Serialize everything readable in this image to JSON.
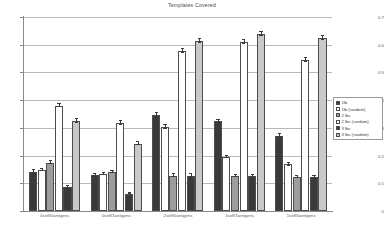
{
  "chart_data": {
    "type": "bar",
    "title": "Templates Covered",
    "xlabel": "",
    "ylabel": "",
    "ylim": [
      0,
      0.7
    ],
    "ytick_values": [
      0,
      0.1,
      0.2,
      0.3,
      0.4,
      0.5,
      0.6,
      0.7
    ],
    "ytick_labels": [
      "0",
      "0.1",
      "0.2",
      "0.3",
      "0.4",
      "0.5",
      "0.6",
      "0.7"
    ],
    "grid": true,
    "legend_position": "right",
    "categories": [
      "0self/0antigens",
      "0self/1antigens",
      "2self/0antigens",
      "1self/1antigens",
      "1self/0antigens"
    ],
    "series": [
      {
        "name": "1lb",
        "color": "#3a3a3a",
        "values": [
          0.142,
          0.13,
          0.345,
          0.323,
          0.272
        ],
        "errors": [
          0.005,
          0.004,
          0.007,
          0.006,
          0.006
        ]
      },
      {
        "name": "1lb (random)",
        "color": "#ffffff",
        "values": [
          0.148,
          0.133,
          0.303,
          0.195,
          0.168
        ],
        "errors": [
          0.004,
          0.004,
          0.006,
          0.005,
          0.005
        ]
      },
      {
        "name": "2 lbs",
        "color": "#9d9d9d",
        "values": [
          0.175,
          0.14,
          0.128,
          0.125,
          0.122
        ],
        "errors": [
          0.005,
          0.004,
          0.004,
          0.004,
          0.004
        ]
      },
      {
        "name": "2 lbs (random)",
        "color": "#ffffff",
        "values": [
          0.38,
          0.318,
          0.578,
          0.61,
          0.545
        ],
        "errors": [
          0.006,
          0.006,
          0.008,
          0.007,
          0.007
        ]
      },
      {
        "name": "3 lbs",
        "color": "#3a3a3a",
        "values": [
          0.088,
          0.063,
          0.128,
          0.125,
          0.122
        ],
        "errors": [
          0.004,
          0.003,
          0.004,
          0.004,
          0.004
        ]
      },
      {
        "name": "3 lbs (random)",
        "color": "#c9c9c9",
        "values": [
          0.325,
          0.243,
          0.612,
          0.64,
          0.625
        ],
        "errors": [
          0.006,
          0.005,
          0.007,
          0.007,
          0.007
        ]
      }
    ]
  }
}
